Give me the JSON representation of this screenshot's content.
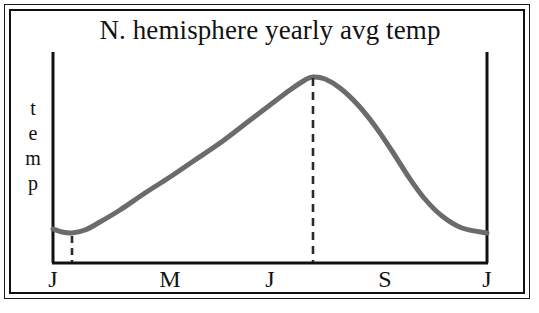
{
  "figure": {
    "title": "N. hemisphere yearly avg temp",
    "y_axis_label_letters": [
      "t",
      "e",
      "m",
      "p"
    ],
    "y_axis_label": "temp",
    "frame_style": "double-rule-border",
    "curve_color": "#6b6b6b",
    "axis_color": "#111111",
    "background_color": "#ffffff"
  },
  "chart_data": {
    "type": "line",
    "title": "N. hemisphere yearly avg temp",
    "xlabel": "",
    "ylabel": "temp",
    "grid": false,
    "legend": null,
    "x_tick_labels": [
      "J",
      "M",
      "J",
      "S",
      "J"
    ],
    "x_tick_positions_px": [
      53,
      170,
      270,
      385,
      487
    ],
    "y_tick_labels": [],
    "xlim": [
      53,
      487
    ],
    "ylim_px": [
      263,
      70
    ],
    "points_px": [
      {
        "x": 53,
        "y": 229
      },
      {
        "x": 62,
        "y": 232
      },
      {
        "x": 72,
        "y": 233
      },
      {
        "x": 85,
        "y": 230
      },
      {
        "x": 100,
        "y": 222
      },
      {
        "x": 120,
        "y": 210
      },
      {
        "x": 145,
        "y": 193
      },
      {
        "x": 170,
        "y": 177
      },
      {
        "x": 195,
        "y": 160
      },
      {
        "x": 220,
        "y": 143
      },
      {
        "x": 245,
        "y": 124
      },
      {
        "x": 270,
        "y": 105
      },
      {
        "x": 290,
        "y": 90
      },
      {
        "x": 305,
        "y": 80
      },
      {
        "x": 313,
        "y": 77
      },
      {
        "x": 325,
        "y": 79
      },
      {
        "x": 340,
        "y": 88
      },
      {
        "x": 358,
        "y": 105
      },
      {
        "x": 375,
        "y": 126
      },
      {
        "x": 392,
        "y": 151
      },
      {
        "x": 408,
        "y": 176
      },
      {
        "x": 424,
        "y": 198
      },
      {
        "x": 442,
        "y": 216
      },
      {
        "x": 462,
        "y": 228
      },
      {
        "x": 487,
        "y": 233
      }
    ],
    "annotations": [
      {
        "name": "minimum-marker",
        "style": "dashed-vertical-line",
        "x_px": 72,
        "y_top_px": 236,
        "y_bottom_px": 262,
        "meaning": "yearly minimum temperature"
      },
      {
        "name": "maximum-marker",
        "style": "dashed-vertical-line",
        "x_px": 313,
        "y_top_px": 78,
        "y_bottom_px": 262,
        "meaning": "yearly maximum temperature"
      }
    ]
  }
}
